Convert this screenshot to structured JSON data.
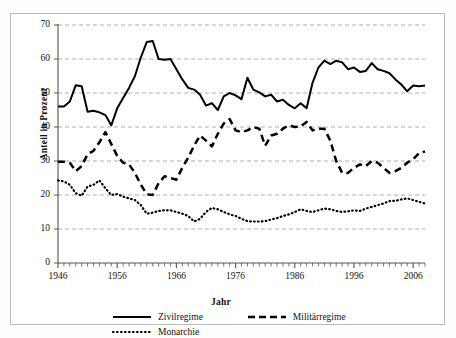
{
  "chart_data": {
    "type": "line",
    "title": "",
    "xlabel": "Jahr",
    "ylabel": "Anteil in Prozent",
    "xlim": [
      1946,
      2008
    ],
    "ylim": [
      0,
      70
    ],
    "yticks": [
      0,
      10,
      20,
      30,
      40,
      50,
      60,
      70
    ],
    "xticks": [
      1946,
      1956,
      1966,
      1976,
      1986,
      1996,
      2006
    ],
    "grid": "horizontal-dashed",
    "legend_position": "bottom",
    "x": [
      1946,
      1947,
      1948,
      1949,
      1950,
      1951,
      1952,
      1953,
      1954,
      1955,
      1956,
      1957,
      1958,
      1959,
      1960,
      1961,
      1962,
      1963,
      1964,
      1965,
      1966,
      1967,
      1968,
      1969,
      1970,
      1971,
      1972,
      1973,
      1974,
      1975,
      1976,
      1977,
      1978,
      1979,
      1980,
      1981,
      1982,
      1983,
      1984,
      1985,
      1986,
      1987,
      1988,
      1989,
      1990,
      1991,
      1992,
      1993,
      1994,
      1995,
      1996,
      1997,
      1998,
      1999,
      2000,
      2001,
      2002,
      2003,
      2004,
      2005,
      2006,
      2007,
      2008
    ],
    "series": [
      {
        "name": "Zivilregime",
        "style": "solid",
        "color": "#000000",
        "values": [
          46.0,
          46.0,
          47.5,
          52.3,
          52.0,
          44.5,
          44.8,
          44.3,
          43.5,
          40.5,
          45.5,
          48.5,
          51.5,
          55.0,
          60.5,
          65.0,
          65.3,
          60.0,
          59.8,
          60.0,
          57.0,
          54.0,
          51.5,
          51.0,
          49.5,
          46.3,
          47.0,
          45.0,
          49.0,
          50.0,
          49.3,
          48.2,
          54.5,
          51.0,
          50.2,
          49.0,
          49.5,
          47.5,
          48.0,
          46.5,
          45.5,
          47.0,
          45.5,
          53.0,
          57.5,
          59.5,
          58.5,
          59.5,
          59.0,
          57.0,
          57.5,
          56.2,
          56.5,
          58.8,
          57.0,
          56.5,
          55.8,
          54.0,
          52.5,
          50.5,
          52.2,
          52.0,
          52.2
        ]
      },
      {
        "name": "Militärregime",
        "style": "dashed",
        "color": "#000000",
        "values": [
          29.8,
          29.8,
          29.5,
          27.0,
          28.5,
          32.0,
          33.0,
          35.5,
          38.5,
          35.0,
          31.5,
          29.5,
          29.0,
          26.5,
          23.0,
          20.2,
          20.0,
          23.5,
          25.5,
          25.0,
          24.5,
          28.0,
          31.0,
          34.5,
          37.5,
          36.0,
          34.3,
          38.0,
          41.0,
          42.3,
          39.0,
          38.5,
          39.0,
          40.0,
          39.5,
          34.5,
          37.5,
          38.0,
          39.5,
          40.5,
          40.0,
          40.2,
          41.5,
          39.0,
          39.5,
          39.5,
          36.0,
          30.0,
          26.5,
          26.5,
          28.0,
          29.0,
          28.5,
          30.0,
          29.5,
          28.0,
          26.5,
          27.0,
          28.0,
          29.5,
          30.5,
          32.3,
          32.8
        ]
      },
      {
        "name": "Monarchie",
        "style": "dotted",
        "color": "#000000",
        "values": [
          24.3,
          24.0,
          23.0,
          20.5,
          19.8,
          22.5,
          23.0,
          24.3,
          22.0,
          20.0,
          20.3,
          19.5,
          19.0,
          18.5,
          17.0,
          14.5,
          14.8,
          15.3,
          15.5,
          15.5,
          15.0,
          14.5,
          13.8,
          12.2,
          13.0,
          15.0,
          16.2,
          15.8,
          15.0,
          14.3,
          13.8,
          13.0,
          12.3,
          12.2,
          12.2,
          12.3,
          12.8,
          13.2,
          13.8,
          14.3,
          15.0,
          15.8,
          15.3,
          15.0,
          15.5,
          16.0,
          15.8,
          15.3,
          15.0,
          15.2,
          15.5,
          15.3,
          16.0,
          16.5,
          17.0,
          17.5,
          18.2,
          18.3,
          18.7,
          19.0,
          18.5,
          18.0,
          17.5
        ]
      }
    ]
  },
  "axes": {
    "ylabel": "Anteil in Prozent",
    "xlabel": "Jahr",
    "yticks": [
      "70",
      "60",
      "50",
      "40",
      "30",
      "20",
      "10",
      "0"
    ],
    "xticks": [
      "1946",
      "1956",
      "1966",
      "1976",
      "1986",
      "1996",
      "2006"
    ]
  },
  "legend": {
    "items": [
      {
        "label": "Zivilregime",
        "style": "solid"
      },
      {
        "label": "Militärregime",
        "style": "dashed"
      },
      {
        "label": "Monarchie",
        "style": "dotted"
      }
    ]
  }
}
